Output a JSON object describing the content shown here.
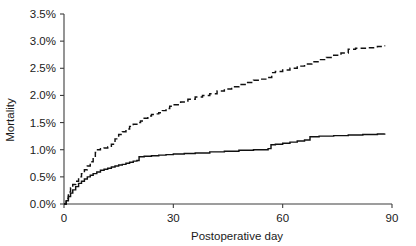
{
  "chart_data": {
    "type": "line",
    "title": "",
    "subtitle": "",
    "xlabel": "Postoperative day",
    "ylabel": "Mortality",
    "xlim": [
      0,
      90
    ],
    "ylim": [
      0,
      3.5
    ],
    "grid": false,
    "legend_position": "none",
    "x_ticks": [
      0,
      30,
      60,
      90
    ],
    "x_tick_labels": [
      "0",
      "30",
      "60",
      "90"
    ],
    "y_ticks": [
      0.0,
      0.5,
      1.0,
      1.5,
      2.0,
      2.5,
      3.0,
      3.5
    ],
    "y_tick_labels": [
      "0.0%",
      "0.5%",
      "1.0%",
      "1.5%",
      "2.0%",
      "2.5%",
      "3.0%",
      "3.5%"
    ],
    "y_unit": "%",
    "series": [
      {
        "name": "dashed-curve",
        "style": "dashed",
        "color": "#111111",
        "points": [
          [
            0,
            0.0
          ],
          [
            0.6,
            0.1
          ],
          [
            1.2,
            0.22
          ],
          [
            1.8,
            0.3
          ],
          [
            2.4,
            0.36
          ],
          [
            3.2,
            0.42
          ],
          [
            4.0,
            0.5
          ],
          [
            4.8,
            0.56
          ],
          [
            5.6,
            0.63
          ],
          [
            6.4,
            0.7
          ],
          [
            7.2,
            0.78
          ],
          [
            8.0,
            0.86
          ],
          [
            8.6,
            0.95
          ],
          [
            9.2,
            1.0
          ],
          [
            10.0,
            1.02
          ],
          [
            11.0,
            1.03
          ],
          [
            12.0,
            1.05
          ],
          [
            13.0,
            1.1
          ],
          [
            14.0,
            1.2
          ],
          [
            15.0,
            1.28
          ],
          [
            16.0,
            1.33
          ],
          [
            17.0,
            1.38
          ],
          [
            18.0,
            1.43
          ],
          [
            19.0,
            1.47
          ],
          [
            20.0,
            1.5
          ],
          [
            21.0,
            1.53
          ],
          [
            22.0,
            1.58
          ],
          [
            23.0,
            1.62
          ],
          [
            24.0,
            1.65
          ],
          [
            25.0,
            1.66
          ],
          [
            26.0,
            1.68
          ],
          [
            27.0,
            1.72
          ],
          [
            28.0,
            1.76
          ],
          [
            29.0,
            1.8
          ],
          [
            30.0,
            1.83
          ],
          [
            32.0,
            1.88
          ],
          [
            34.0,
            1.93
          ],
          [
            36.0,
            1.97
          ],
          [
            38.0,
            2.0
          ],
          [
            40.0,
            2.03
          ],
          [
            42.0,
            2.08
          ],
          [
            44.0,
            2.12
          ],
          [
            46.0,
            2.16
          ],
          [
            48.0,
            2.2
          ],
          [
            50.0,
            2.24
          ],
          [
            52.0,
            2.28
          ],
          [
            54.0,
            2.3
          ],
          [
            56.0,
            2.33
          ],
          [
            57.0,
            2.42
          ],
          [
            58.0,
            2.44
          ],
          [
            60.0,
            2.47
          ],
          [
            62.0,
            2.5
          ],
          [
            64.0,
            2.54
          ],
          [
            66.0,
            2.58
          ],
          [
            68.0,
            2.62
          ],
          [
            70.0,
            2.66
          ],
          [
            72.0,
            2.7
          ],
          [
            74.0,
            2.74
          ],
          [
            76.0,
            2.78
          ],
          [
            78.0,
            2.85
          ],
          [
            80.0,
            2.87
          ],
          [
            83.0,
            2.88
          ],
          [
            86.0,
            2.9
          ],
          [
            88.0,
            2.92
          ]
        ]
      },
      {
        "name": "solid-curve",
        "style": "solid",
        "color": "#111111",
        "points": [
          [
            0,
            0.0
          ],
          [
            0.6,
            0.06
          ],
          [
            1.2,
            0.14
          ],
          [
            1.8,
            0.2
          ],
          [
            2.4,
            0.26
          ],
          [
            3.2,
            0.32
          ],
          [
            4.0,
            0.38
          ],
          [
            4.8,
            0.42
          ],
          [
            5.6,
            0.46
          ],
          [
            6.4,
            0.5
          ],
          [
            7.2,
            0.53
          ],
          [
            8.0,
            0.56
          ],
          [
            9.0,
            0.59
          ],
          [
            10.0,
            0.62
          ],
          [
            11.0,
            0.64
          ],
          [
            12.0,
            0.66
          ],
          [
            13.0,
            0.68
          ],
          [
            14.0,
            0.7
          ],
          [
            15.0,
            0.72
          ],
          [
            16.0,
            0.73
          ],
          [
            17.0,
            0.75
          ],
          [
            18.0,
            0.77
          ],
          [
            19.0,
            0.79
          ],
          [
            20.0,
            0.8
          ],
          [
            20.6,
            0.87
          ],
          [
            22.0,
            0.88
          ],
          [
            24.0,
            0.89
          ],
          [
            26.0,
            0.9
          ],
          [
            28.0,
            0.91
          ],
          [
            30.0,
            0.92
          ],
          [
            33.0,
            0.93
          ],
          [
            36.0,
            0.94
          ],
          [
            40.0,
            0.96
          ],
          [
            44.0,
            0.97
          ],
          [
            48.0,
            0.99
          ],
          [
            52.0,
            1.0
          ],
          [
            56.0,
            1.02
          ],
          [
            56.8,
            1.09
          ],
          [
            58.0,
            1.1
          ],
          [
            60.0,
            1.12
          ],
          [
            62.0,
            1.14
          ],
          [
            64.0,
            1.16
          ],
          [
            66.0,
            1.18
          ],
          [
            67.5,
            1.24
          ],
          [
            70.0,
            1.25
          ],
          [
            74.0,
            1.26
          ],
          [
            78.0,
            1.27
          ],
          [
            82.0,
            1.28
          ],
          [
            86.0,
            1.29
          ],
          [
            88.0,
            1.3
          ]
        ]
      }
    ]
  },
  "axes": {
    "y_title": "Mortality",
    "x_title": "Postoperative day"
  }
}
